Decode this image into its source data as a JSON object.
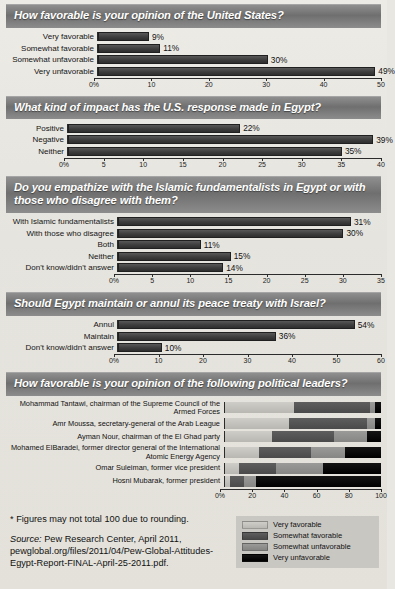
{
  "chart_data": [
    {
      "type": "bar",
      "title": "How favorable is your opinion of the United States?",
      "categories": [
        "Very favorable",
        "Somewhat favorable",
        "Somewhat unfavorable",
        "Very unfavorable"
      ],
      "values": [
        9,
        11,
        30,
        49
      ],
      "value_labels": [
        "9%",
        "11%",
        "30%",
        "49%"
      ],
      "xlabel": "",
      "ylabel": "",
      "xlim": [
        0,
        50
      ],
      "ticks": [
        0,
        10,
        20,
        30,
        40,
        50
      ],
      "tick_labels": [
        "0%",
        "10",
        "20",
        "30",
        "40",
        "50"
      ],
      "grid": false,
      "label_width": 88
    },
    {
      "type": "bar",
      "title": "What kind of impact has the U.S. response made in Egypt?",
      "categories": [
        "Positive",
        "Negative",
        "Neither"
      ],
      "values": [
        22,
        39,
        35
      ],
      "value_labels": [
        "22%",
        "39%",
        "35%"
      ],
      "xlabel": "",
      "ylabel": "",
      "xlim": [
        0,
        40
      ],
      "ticks": [
        0,
        5,
        10,
        15,
        20,
        25,
        30,
        35,
        40
      ],
      "tick_labels": [
        "0%",
        "5",
        "10",
        "15",
        "20",
        "25",
        "30",
        "35",
        "40"
      ],
      "grid": false,
      "label_width": 58
    },
    {
      "type": "bar",
      "title": "Do you empathize with the Islamic fundamentalists in Egypt or with those who disagree with them?",
      "categories": [
        "With Islamic fundamentalists",
        "With those who disagree",
        "Both",
        "Neither",
        "Don't know/didn't answer"
      ],
      "values": [
        31,
        30,
        11,
        15,
        14
      ],
      "value_labels": [
        "31%",
        "30%",
        "11%",
        "15%",
        "14%"
      ],
      "xlabel": "",
      "ylabel": "",
      "xlim": [
        0,
        35
      ],
      "ticks": [
        0,
        5,
        10,
        15,
        20,
        25,
        30,
        35
      ],
      "tick_labels": [
        "0%",
        "5",
        "10",
        "15",
        "20",
        "25",
        "30",
        "35"
      ],
      "grid": false,
      "label_width": 108
    },
    {
      "type": "bar",
      "title": "Should Egypt maintain or annul its peace treaty with Israel?",
      "categories": [
        "Annul",
        "Maintain",
        "Don't know/didn't answer"
      ],
      "values": [
        54,
        36,
        10
      ],
      "value_labels": [
        "54%",
        "36%",
        "10%"
      ],
      "xlabel": "",
      "ylabel": "",
      "xlim": [
        0,
        60
      ],
      "ticks": [
        0,
        10,
        20,
        30,
        40,
        50,
        60
      ],
      "tick_labels": [
        "0%",
        "10",
        "20",
        "30",
        "40",
        "50",
        "60"
      ],
      "grid": false,
      "label_width": 108
    },
    {
      "type": "bar",
      "stacked": true,
      "title": "How favorable is your opinion of the following political leaders?",
      "categories": [
        "Mohammad Tantawi, chairman of the Supreme Council of the Armed Forces",
        "Amr Moussa, secretary-general of the Arab League",
        "Ayman Nour, chairman of the El Ghad party",
        "Mohamed ElBaradei, former director general of the International Atomic Energy Agency",
        "Omar Suleiman, former vice president",
        "Hosni Mubarak, former president"
      ],
      "series": [
        {
          "name": "Very favorable",
          "values": [
            44,
            41,
            30,
            22,
            9,
            3
          ]
        },
        {
          "name": "Somewhat favorable",
          "values": [
            49,
            50,
            40,
            33,
            24,
            9
          ]
        },
        {
          "name": "Somewhat unfavorable",
          "values": [
            3,
            5,
            21,
            22,
            30,
            8
          ]
        },
        {
          "name": "Very unfavorable",
          "values": [
            4,
            4,
            9,
            23,
            37,
            80
          ]
        }
      ],
      "xlim": [
        0,
        100
      ],
      "ticks": [
        0,
        20,
        40,
        60,
        80,
        100
      ],
      "tick_labels": [
        "0%",
        "20",
        "40",
        "60",
        "80",
        "100"
      ],
      "grid": false,
      "label_width": 214
    }
  ],
  "legend": {
    "position": "bottom-right",
    "items": [
      {
        "label": "Very favorable",
        "color": "#cfcdc8"
      },
      {
        "label": "Somewhat favorable",
        "color": "#5e5e5e"
      },
      {
        "label": "Somewhat unfavorable",
        "color": "#9a9a98"
      },
      {
        "label": "Very unfavorable",
        "color": "#141414"
      }
    ]
  },
  "footnote": "* Figures may not total 100 due to rounding.",
  "source": {
    "label": "Source:",
    "text": " Pew Research Center, April 2011, pewglobal.org/files/2011/04/Pew-Global-Attitudes-Egypt-Report-FINAL-April-25-2011.pdf."
  },
  "colors": {
    "banner_text": "#ffffff",
    "bar_fill": "#3d3d3d",
    "page_bg": "#e9e7e2"
  }
}
